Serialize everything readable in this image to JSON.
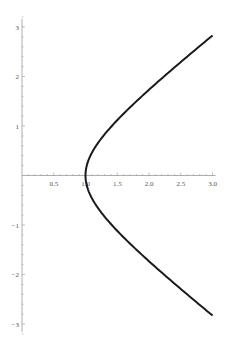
{
  "chart_data": {
    "type": "line",
    "title": "",
    "xlabel": "",
    "ylabel": "",
    "xlim": [
      0,
      3.0
    ],
    "ylim": [
      -3,
      3
    ],
    "x_ticks": [
      "0.5",
      "1.0",
      "1.5",
      "2.0",
      "2.5",
      "3.0"
    ],
    "y_ticks": [
      "3",
      "2",
      "1",
      "-1",
      "-2",
      "-3"
    ],
    "grid": false,
    "legend": null,
    "series": [
      {
        "name": "x^2 - y^2 = 1",
        "color": "#1a1a1a",
        "x": [
          3.0,
          2.5,
          2.0,
          1.5,
          1.25,
          1.1,
          1.0,
          1.1,
          1.25,
          1.5,
          2.0,
          2.5,
          3.0
        ],
        "y": [
          2.83,
          2.29,
          1.73,
          1.12,
          0.75,
          0.46,
          0.0,
          -0.46,
          -0.75,
          -1.12,
          -1.73,
          -2.29,
          -2.83
        ]
      }
    ]
  },
  "layout": {
    "origin_px": [
      22,
      175.5
    ],
    "px_per_x": 63.5,
    "px_per_y": 49.5,
    "axis_color": "#999999",
    "curve_color": "#1a1a1a"
  }
}
